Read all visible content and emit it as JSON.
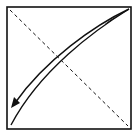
{
  "diagram": {
    "type": "origami-fold-step",
    "colors": {
      "background": "#ffffff",
      "stroke": "#111111"
    },
    "elements": {
      "square": {
        "x": 7,
        "y": 7,
        "width": 124,
        "height": 122
      },
      "fold_line": {
        "style": "dashed",
        "from": "top-left",
        "to": "bottom-right"
      },
      "fold_arrow": {
        "from": "top-right",
        "to": "bottom-left"
      }
    }
  }
}
